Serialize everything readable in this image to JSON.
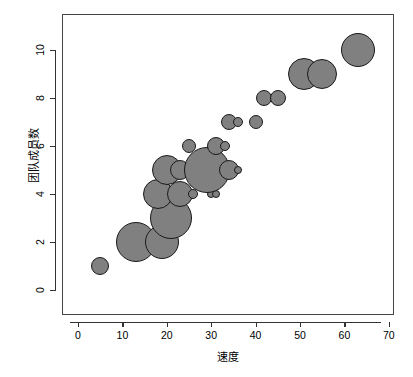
{
  "chart_data": {
    "type": "scatter",
    "title": "",
    "subtitle": "",
    "xlabel": "速度",
    "ylabel": "团队成员数",
    "xlim": [
      -3,
      72
    ],
    "ylim": [
      -0.6,
      11.3
    ],
    "xticks": [
      0,
      10,
      20,
      30,
      40,
      50,
      60,
      70
    ],
    "yticks": [
      0,
      2,
      4,
      6,
      8,
      10
    ],
    "grid": false,
    "legend": null,
    "marker": {
      "shape": "circle",
      "fill_color": "#808080",
      "edge_color": "#1a1a1a",
      "size_encodes": "bubble-area"
    },
    "points": [
      {
        "x": 5,
        "y": 1,
        "r": 9
      },
      {
        "x": 13,
        "y": 2,
        "r": 20
      },
      {
        "x": 19,
        "y": 2,
        "r": 17
      },
      {
        "x": 21,
        "y": 3,
        "r": 21
      },
      {
        "x": 18,
        "y": 4,
        "r": 15
      },
      {
        "x": 23,
        "y": 4,
        "r": 13
      },
      {
        "x": 26,
        "y": 4,
        "r": 5
      },
      {
        "x": 30,
        "y": 4,
        "r": 4
      },
      {
        "x": 31,
        "y": 4,
        "r": 4
      },
      {
        "x": 20,
        "y": 5,
        "r": 15
      },
      {
        "x": 23,
        "y": 5,
        "r": 10
      },
      {
        "x": 29,
        "y": 5,
        "r": 23
      },
      {
        "x": 34,
        "y": 5,
        "r": 10
      },
      {
        "x": 36,
        "y": 5,
        "r": 4
      },
      {
        "x": 25,
        "y": 6,
        "r": 7
      },
      {
        "x": 31,
        "y": 6,
        "r": 9
      },
      {
        "x": 33,
        "y": 6,
        "r": 5
      },
      {
        "x": 34,
        "y": 7,
        "r": 8
      },
      {
        "x": 36,
        "y": 7,
        "r": 5
      },
      {
        "x": 40,
        "y": 7,
        "r": 7
      },
      {
        "x": 42,
        "y": 8,
        "r": 8
      },
      {
        "x": 45,
        "y": 8,
        "r": 8
      },
      {
        "x": 51,
        "y": 9,
        "r": 16
      },
      {
        "x": 55,
        "y": 9,
        "r": 15
      },
      {
        "x": 63,
        "y": 10,
        "r": 17
      }
    ]
  }
}
